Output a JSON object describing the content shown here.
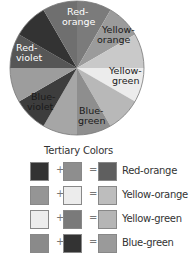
{
  "wheel": {
    "wedges": [
      {
        "name": "red-orange-right",
        "color": "#7b7b7b"
      },
      {
        "name": "orange",
        "color": "#9b9b9b"
      },
      {
        "name": "yellow-orange",
        "color": "#c9c9c9"
      },
      {
        "name": "yellow",
        "color": "#ececec"
      },
      {
        "name": "yellow-green",
        "color": "#b8b8b8"
      },
      {
        "name": "green",
        "color": "#8e8e8e"
      },
      {
        "name": "blue-green",
        "color": "#a6a6a6"
      },
      {
        "name": "blue",
        "color": "#3d3d3d"
      },
      {
        "name": "blue-violet",
        "color": "#9d9d9d"
      },
      {
        "name": "violet",
        "color": "#565656"
      },
      {
        "name": "red-violet",
        "color": "#333333"
      },
      {
        "name": "red",
        "color": "#6f6f6f"
      }
    ],
    "labels": [
      {
        "line1": "Red-",
        "line2": "orange"
      },
      {
        "line1": "Yellow-",
        "line2": "orange"
      },
      {
        "line1": "Yellow-",
        "line2": "green"
      },
      {
        "line1": "Blue-",
        "line2": "green"
      },
      {
        "line1": "Blue-",
        "line2": "violet"
      },
      {
        "line1": "Red-",
        "line2": "violet"
      }
    ]
  },
  "legend": {
    "title": "Tertiary Colors",
    "plus": "+",
    "equals": "=",
    "rows": [
      {
        "a": "#333333",
        "b": "#8e8e8e",
        "result": "#5f5f5f",
        "label": "Red-orange"
      },
      {
        "a": "#959595",
        "b": "#ececec",
        "result": "#bdbdbd",
        "label": "Yellow-orange"
      },
      {
        "a": "#ededed",
        "b": "#7a7a7a",
        "result": "#b5b5b5",
        "label": "Yellow-green"
      },
      {
        "a": "#8a8a8a",
        "b": "#333333",
        "result": "#9a9a9a",
        "label": "Blue-green"
      }
    ]
  }
}
